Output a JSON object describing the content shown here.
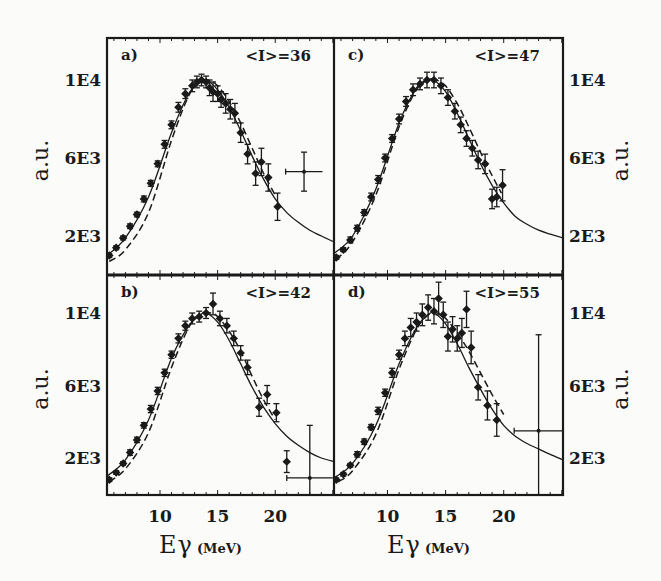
{
  "figure": {
    "x_axis_title_main": "E",
    "x_axis_title_sub": "γ",
    "x_axis_unit": "(MeV)",
    "y_axis_title": "a.u.",
    "x_tick_labels": [
      "10",
      "15",
      "20"
    ],
    "y_tick_labels_top": [
      "1E4",
      "6E3",
      "2E3"
    ],
    "y_tick_labels_bottom": [
      "1E4",
      "6E3",
      "2E3"
    ]
  },
  "chart_data": [
    {
      "type": "scatter",
      "panel": "a)",
      "annotation": "<I>=36",
      "title": "",
      "xlabel": "Eγ (MeV)",
      "ylabel": "a.u.",
      "xlim": [
        5.4,
        25.1
      ],
      "ylim": [
        0,
        12150
      ],
      "x_ticks": [
        10,
        15,
        20
      ],
      "y_ticks": [
        10000,
        6000,
        2000
      ],
      "y_tick_labels": [
        "1E4",
        "6E3",
        "2E3"
      ],
      "y_axis_side": "left",
      "series": [
        {
          "name": "data",
          "style": "points-with-errorbars",
          "x": [
            5.6,
            6.2,
            6.8,
            7.4,
            8.0,
            8.6,
            9.2,
            9.8,
            10.4,
            11.0,
            11.6,
            12.2,
            12.8,
            13.2,
            13.6,
            14.0,
            14.3,
            14.6,
            15.0,
            15.3,
            15.7,
            16.1,
            16.5,
            17.0,
            17.6,
            18.3,
            18.8,
            19.4,
            20.2
          ],
          "y": [
            1000,
            1400,
            1900,
            2500,
            3100,
            3900,
            4700,
            5700,
            6700,
            7700,
            8600,
            9300,
            9700,
            9900,
            10000,
            9900,
            9600,
            9400,
            9300,
            9000,
            8800,
            8500,
            8300,
            7300,
            6200,
            5200,
            5800,
            5000,
            3500
          ],
          "yerr": [
            100,
            100,
            100,
            120,
            120,
            150,
            150,
            150,
            200,
            200,
            250,
            250,
            300,
            300,
            300,
            300,
            400,
            500,
            400,
            400,
            500,
            500,
            500,
            500,
            500,
            600,
            700,
            700,
            700
          ]
        },
        {
          "name": "wide-bin point",
          "style": "point-with-x-and-y-errorbars",
          "x": [
            22.5
          ],
          "xerr": [
            1.6
          ],
          "y": [
            5300
          ],
          "yerr": [
            1000
          ]
        },
        {
          "name": "fit (solid)",
          "style": "solid-line",
          "x": [
            5.4,
            7,
            9,
            11,
            12.5,
            13.5,
            14,
            15,
            16,
            17,
            18,
            19,
            20,
            21,
            22,
            23,
            24,
            25.1
          ],
          "y": [
            1000,
            1900,
            4000,
            7300,
            9300,
            9900,
            10000,
            9500,
            8600,
            7400,
            6100,
            4900,
            3900,
            3200,
            2700,
            2300,
            2000,
            1700
          ]
        },
        {
          "name": "fit (dashed)",
          "style": "dashed-line",
          "x": [
            5.6,
            7,
            9,
            11,
            12.5,
            13.5,
            14.2,
            15,
            16,
            17,
            18,
            19,
            20
          ],
          "y": [
            700,
            1300,
            3200,
            6900,
            9200,
            9900,
            10000,
            9700,
            8900,
            7800,
            6500,
            5200,
            4100
          ]
        }
      ]
    },
    {
      "type": "scatter",
      "panel": "c)",
      "annotation": "<I>=47",
      "xlabel": "Eγ (MeV)",
      "ylabel": "a.u.",
      "xlim": [
        5.4,
        25.1
      ],
      "ylim": [
        0,
        12150
      ],
      "x_ticks": [
        10,
        15,
        20
      ],
      "y_ticks": [
        10000,
        6000,
        2000
      ],
      "y_tick_labels": [
        "1E4",
        "6E3",
        "2E3"
      ],
      "y_axis_side": "right",
      "series": [
        {
          "name": "data",
          "style": "points-with-errorbars",
          "x": [
            5.6,
            6.2,
            6.8,
            7.4,
            8.0,
            8.6,
            9.2,
            9.8,
            10.4,
            11.0,
            11.6,
            12.2,
            12.8,
            13.4,
            14.0,
            14.6,
            15.2,
            15.8,
            16.3,
            16.8,
            17.3,
            17.8,
            18.4,
            19.0,
            19.4,
            19.9
          ],
          "y": [
            900,
            1300,
            1800,
            2400,
            3200,
            4000,
            4900,
            6000,
            7000,
            8000,
            8900,
            9500,
            9800,
            10000,
            10000,
            9700,
            9100,
            8400,
            7700,
            7000,
            6500,
            5900,
            5700,
            3900,
            4000,
            4600
          ],
          "yerr": [
            100,
            100,
            150,
            150,
            150,
            200,
            200,
            200,
            200,
            250,
            250,
            300,
            300,
            400,
            400,
            400,
            400,
            400,
            400,
            400,
            400,
            450,
            500,
            500,
            500,
            800
          ]
        },
        {
          "name": "fit (solid)",
          "style": "solid-line",
          "x": [
            5.4,
            7,
            9,
            11,
            12.5,
            13.5,
            14,
            15,
            16,
            17,
            18,
            19,
            20,
            21,
            22,
            23,
            24,
            25.1
          ],
          "y": [
            1100,
            2000,
            4400,
            7800,
            9600,
            10000,
            10000,
            9400,
            8300,
            7000,
            5700,
            4600,
            3700,
            3000,
            2600,
            2300,
            2100,
            1900
          ]
        },
        {
          "name": "fit (dashed)",
          "style": "dashed-line",
          "x": [
            5.6,
            7,
            9,
            11,
            12.5,
            13.5,
            14.2,
            15,
            16,
            17,
            18,
            19,
            19.8
          ],
          "y": [
            800,
            1700,
            4100,
            7600,
            9500,
            10000,
            10000,
            9700,
            8800,
            7600,
            6300,
            5100,
            4200
          ]
        }
      ]
    },
    {
      "type": "scatter",
      "panel": "b)",
      "annotation": "<I>=42",
      "xlabel": "Eγ (MeV)",
      "ylabel": "a.u.",
      "xlim": [
        5.4,
        25.1
      ],
      "ylim": [
        0,
        12150
      ],
      "x_ticks": [
        10,
        15,
        20
      ],
      "y_ticks": [
        10000,
        6000,
        2000
      ],
      "y_tick_labels": [
        "1E4",
        "6E3",
        "2E3"
      ],
      "y_axis_side": "left",
      "series": [
        {
          "name": "data",
          "style": "points-with-errorbars",
          "x": [
            5.6,
            6.2,
            6.8,
            7.4,
            8.0,
            8.6,
            9.2,
            9.8,
            10.4,
            11.0,
            11.6,
            12.2,
            12.8,
            13.4,
            14.0,
            14.6,
            15.2,
            15.8,
            16.4,
            17.0,
            17.6,
            18.6,
            19.3,
            20.1,
            21.0
          ],
          "y": [
            800,
            1200,
            1700,
            2300,
            3000,
            3800,
            4700,
            5700,
            6700,
            7700,
            8600,
            9300,
            9700,
            9800,
            10000,
            10500,
            9700,
            9300,
            8600,
            7800,
            7000,
            4800,
            5500,
            4500,
            1800
          ],
          "yerr": [
            100,
            100,
            100,
            150,
            150,
            150,
            200,
            200,
            200,
            200,
            250,
            250,
            300,
            300,
            300,
            600,
            400,
            400,
            400,
            400,
            400,
            500,
            500,
            500,
            600
          ]
        },
        {
          "name": "wide-bin point",
          "style": "point-with-x-and-y-errorbars",
          "x": [
            23.0
          ],
          "xerr": [
            2.0
          ],
          "y": [
            900
          ],
          "yerr": [
            2900
          ]
        },
        {
          "name": "fit (solid)",
          "style": "solid-line",
          "x": [
            5.4,
            7,
            9,
            11,
            12.5,
            13.5,
            14,
            15,
            16,
            17,
            18,
            19,
            20,
            21,
            22,
            23,
            24,
            25.1
          ],
          "y": [
            1000,
            1900,
            4100,
            7500,
            9300,
            9900,
            10000,
            9500,
            8500,
            7200,
            5900,
            4800,
            3900,
            3200,
            2700,
            2300,
            2000,
            1800
          ]
        },
        {
          "name": "fit (dashed)",
          "style": "dashed-line",
          "x": [
            5.6,
            7,
            9,
            11,
            12.5,
            13.5,
            14.4,
            15,
            16,
            17,
            18,
            19,
            20
          ],
          "y": [
            700,
            1400,
            3400,
            7000,
            9200,
            9900,
            10000,
            9800,
            9000,
            7900,
            6500,
            5200,
            4100
          ]
        }
      ]
    },
    {
      "type": "scatter",
      "panel": "d)",
      "annotation": "<I>=55",
      "xlabel": "Eγ (MeV)",
      "ylabel": "a.u.",
      "xlim": [
        5.4,
        25.1
      ],
      "ylim": [
        0,
        12150
      ],
      "x_ticks": [
        10,
        15,
        20
      ],
      "y_ticks": [
        10000,
        6000,
        2000
      ],
      "y_tick_labels": [
        "1E4",
        "6E3",
        "2E3"
      ],
      "y_axis_side": "right",
      "series": [
        {
          "name": "data",
          "style": "points-with-errorbars",
          "x": [
            5.6,
            6.2,
            6.8,
            7.4,
            8.0,
            8.6,
            9.2,
            9.8,
            10.4,
            11.0,
            11.5,
            12.0,
            12.5,
            13.0,
            13.5,
            14.0,
            14.4,
            14.8,
            15.2,
            15.6,
            16.0,
            16.4,
            16.8,
            17.2,
            17.8,
            18.6,
            19.4
          ],
          "y": [
            800,
            1100,
            1600,
            2200,
            2900,
            3700,
            4600,
            5600,
            6700,
            7700,
            8600,
            9200,
            9500,
            9900,
            10300,
            10100,
            10800,
            9900,
            8700,
            9100,
            8600,
            8900,
            10200,
            8100,
            5900,
            4900,
            4100
          ],
          "yerr": [
            100,
            100,
            100,
            150,
            150,
            150,
            200,
            200,
            250,
            250,
            400,
            500,
            500,
            600,
            700,
            700,
            900,
            700,
            800,
            700,
            700,
            800,
            1000,
            900,
            700,
            800,
            900
          ]
        },
        {
          "name": "wide-bin point",
          "style": "point-with-x-and-y-errorbars",
          "x": [
            23.0
          ],
          "xerr": [
            2.1
          ],
          "y": [
            3500
          ],
          "yerr": [
            5300
          ]
        },
        {
          "name": "fit (solid)",
          "style": "solid-line",
          "x": [
            5.4,
            7,
            9,
            11,
            12.5,
            13.5,
            14,
            15,
            16,
            17,
            18,
            19,
            20,
            21,
            22,
            23,
            24,
            25.1
          ],
          "y": [
            900,
            1700,
            3800,
            7200,
            9200,
            9900,
            10000,
            9400,
            8300,
            7000,
            5800,
            4700,
            3800,
            3200,
            2800,
            2500,
            2200,
            1900
          ]
        },
        {
          "name": "fit (dashed)",
          "style": "dashed-line",
          "x": [
            5.8,
            7,
            9,
            11,
            12.5,
            13.5,
            14.3,
            15,
            16,
            17,
            18,
            19,
            20
          ],
          "y": [
            700,
            1300,
            3300,
            6900,
            9100,
            9900,
            10000,
            9700,
            8900,
            7900,
            6700,
            5500,
            4400
          ]
        }
      ]
    }
  ]
}
